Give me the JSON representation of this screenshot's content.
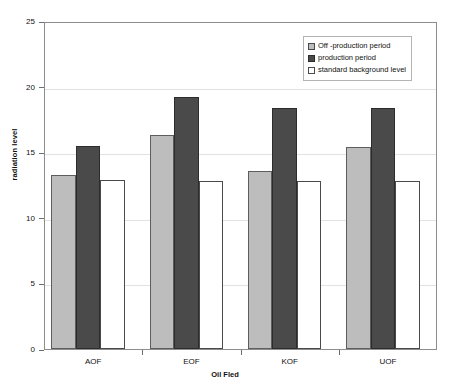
{
  "chart_data": {
    "type": "bar",
    "title": "",
    "xlabel": "Oil Fled",
    "ylabel": "radiation level",
    "categories": [
      "AOF",
      "EOF",
      "KOF",
      "UOF"
    ],
    "series": [
      {
        "name": "Off -production period",
        "color": "#bdbdbd",
        "values": [
          13.3,
          16.3,
          13.6,
          15.4
        ]
      },
      {
        "name": "production period",
        "color": "#4a4a4a",
        "values": [
          15.5,
          19.2,
          18.4,
          18.4
        ]
      },
      {
        "name": "standard background level",
        "color": "#ffffff",
        "values": [
          12.9,
          12.8,
          12.8,
          12.8
        ]
      }
    ],
    "ylim": [
      0,
      25
    ],
    "yticks": [
      0,
      5,
      10,
      15,
      20,
      25
    ],
    "ytick_labels": [
      "0",
      "5",
      "10",
      "15",
      "20",
      "25"
    ],
    "grid": true,
    "legend_position": "top-right"
  }
}
